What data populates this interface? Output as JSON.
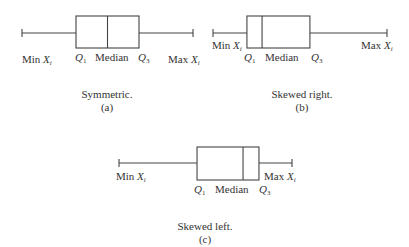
{
  "diagram": {
    "panels": [
      {
        "id": "a",
        "caption": "Symmetric.",
        "letter": "(a)",
        "labels": {
          "min": "Min",
          "max": "Max",
          "var": "X",
          "sub": "i",
          "q1": "Q",
          "q1_sub": "1",
          "median": "Median",
          "q3": "Q",
          "q3_sub": "3"
        },
        "five_number": {
          "min": 0,
          "q1": 0.3158,
          "median": 0.5,
          "q3": 0.6842,
          "max": 1
        }
      },
      {
        "id": "b",
        "caption": "Skewed right.",
        "letter": "(b)",
        "labels": {
          "min": "Min",
          "max": "Max",
          "var": "X",
          "sub": "i",
          "q1": "Q",
          "q1_sub": "1",
          "median": "Median",
          "q3": "Q",
          "q3_sub": "3"
        },
        "five_number": {
          "min": 0,
          "q1": 0.195,
          "median": 0.282,
          "q3": 0.557,
          "max": 1
        }
      },
      {
        "id": "c",
        "caption": "Skewed left.",
        "letter": "(c)",
        "labels": {
          "min": "Min",
          "max": "Max",
          "var": "X",
          "sub": "i",
          "q1": "Q",
          "q1_sub": "1",
          "median": "Median",
          "q3": "Q",
          "q3_sub": "3"
        },
        "five_number": {
          "min": 0,
          "q1": 0.451,
          "median": 0.717,
          "q3": 0.809,
          "max": 1
        }
      }
    ]
  }
}
